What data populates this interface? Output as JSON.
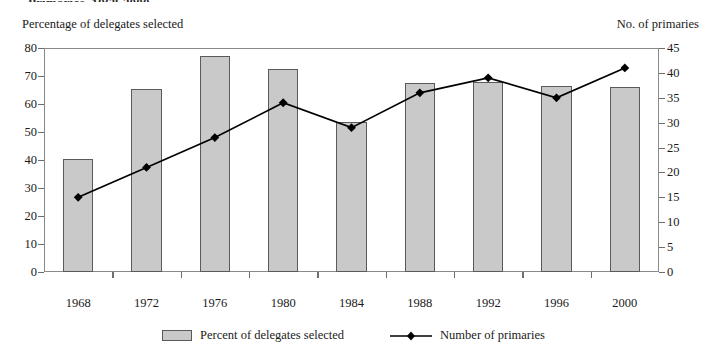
{
  "title_partial": "Primaries, 1968-2000",
  "axis_captions": {
    "left": "Percentage of delegates selected",
    "right": "No. of primaries"
  },
  "legend": {
    "bar_label": "Percent of delegates selected",
    "line_label": "Number of primaries"
  },
  "colors": {
    "bar_fill": "#c9c9c9",
    "bar_edge": "#5a5a5a",
    "line": "#000000",
    "axis": "#8a8a8a",
    "text": "#1a1a1a"
  },
  "chart_data": {
    "type": "bar",
    "title": "Primaries, 1968-2000",
    "xlabel": "",
    "ylabel": "Percentage of delegates selected",
    "y2label": "No. of primaries",
    "categories": [
      "1968",
      "1972",
      "1976",
      "1980",
      "1984",
      "1988",
      "1992",
      "1996",
      "2000"
    ],
    "ylim": [
      0,
      80
    ],
    "y2lim": [
      0,
      45
    ],
    "yticks": [
      0,
      10,
      20,
      30,
      40,
      50,
      60,
      70,
      80
    ],
    "y2ticks": [
      0,
      5,
      10,
      15,
      20,
      25,
      30,
      35,
      40,
      45
    ],
    "grid": false,
    "legend_position": "bottom",
    "series": [
      {
        "name": "Percent of delegates selected",
        "type": "bar",
        "axis": "left",
        "values": [
          40.5,
          65.5,
          77,
          72.5,
          53.5,
          67.5,
          68,
          66.5,
          66
        ]
      },
      {
        "name": "Number of primaries",
        "type": "line",
        "axis": "right",
        "marker": "diamond",
        "values": [
          15,
          21,
          27,
          34,
          29,
          36,
          39,
          35,
          41
        ]
      }
    ]
  }
}
